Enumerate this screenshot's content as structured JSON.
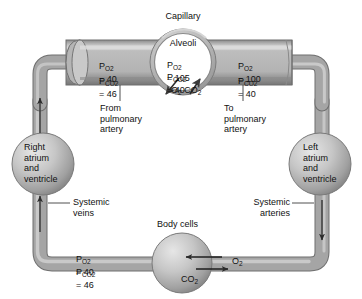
{
  "figure": {
    "type": "physiology-flow-diagram",
    "background": "#ffffff",
    "vessel_color": "#9a9a9a",
    "vessel_light": "#c4c4c4",
    "vessel_dark": "#6e6e6e",
    "text_color": "#111111"
  },
  "labels": {
    "capillary": "Capillary",
    "alveoli": "Alveoli",
    "from_pulmonary_artery": "From\npulmonary\nartery",
    "to_pulmonary_artery": "To\npulmonary\nartery",
    "right_heart": "Right\natrium\nand\nventricle",
    "left_heart": "Left\natrium\nand\nventricle",
    "systemic_veins": "Systemic\nveins",
    "systemic_arteries": "Systemic\narteries",
    "body_cells": "Body cells"
  },
  "gases": {
    "o2_symbol": "O",
    "o2_sub": "2",
    "co2_symbol": "CO",
    "co2_sub": "2",
    "p_symbol": "P"
  },
  "partial_pressures": {
    "pulmonary_capillary_in": {
      "location": "From pulmonary artery (deoxygenated blood)",
      "po2_label": "P",
      "po2_sub": "O",
      "po2_sub2": "2",
      "po2_value": "= 40",
      "pco2_sub": "CO",
      "pco2_sub2": "2",
      "pco2_value": "= 46"
    },
    "alveolus": {
      "location": "Alveoli",
      "po2_value": "= 105",
      "pco2_value": "= 40"
    },
    "pulmonary_capillary_out": {
      "location": "To pulmonary artery (oxygenated blood)",
      "po2_value": "= 100",
      "pco2_value": "= 40"
    },
    "systemic_capillary": {
      "location": "Body cells / systemic veins",
      "po2_value": "= 40",
      "pco2_value": "= 46"
    }
  },
  "exchange_arrows": {
    "alveolus_o2_direction": "into blood (down-left)",
    "alveolus_co2_direction": "into alveolus (up-right)",
    "body_o2_direction": "into cell (left)",
    "body_co2_direction": "out of cell (right)"
  },
  "flow_arrows": {
    "left_vessel": "up",
    "right_vessel": "down",
    "systemic_veins_marker": "up",
    "systemic_arteries_marker": "down"
  }
}
